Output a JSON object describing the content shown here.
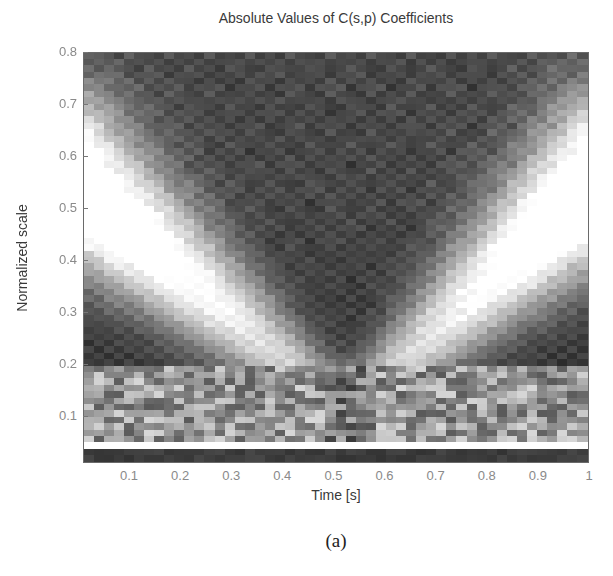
{
  "chart_data": {
    "type": "heatmap",
    "title": "Absolute Values of C(s,p) Coefficients",
    "xlabel": "Time [s]",
    "ylabel": "Normalized scale",
    "caption": "(a)",
    "colormap": "gray",
    "xlim": [
      0.01,
      1.0
    ],
    "ylim": [
      0.01,
      0.8
    ],
    "xticks": [
      0.1,
      0.2,
      0.3,
      0.4,
      0.5,
      0.6,
      0.7,
      0.8,
      0.9,
      1
    ],
    "xtick_labels": [
      "0.1",
      "0.2",
      "0.3",
      "0.4",
      "0.5",
      "0.6",
      "0.7",
      "0.8",
      "0.9",
      "1"
    ],
    "yticks": [
      0.1,
      0.2,
      0.3,
      0.4,
      0.5,
      0.6,
      0.7,
      0.8
    ],
    "ytick_labels": [
      "0.1",
      "0.2",
      "0.3",
      "0.4",
      "0.5",
      "0.6",
      "0.7",
      "0.8"
    ],
    "grid": false,
    "legend": null,
    "grid_cells": {
      "cols": 50,
      "rows": 64
    },
    "features": {
      "v_apex_time": 0.53,
      "v_apex_scale": 0.12,
      "left_ridge": {
        "from": [
          0.47,
          0.15
        ],
        "to": [
          0.01,
          0.53
        ],
        "intensity": 1.0
      },
      "right_ridge": {
        "from": [
          0.58,
          0.15
        ],
        "to": [
          1.0,
          0.53
        ],
        "intensity": 1.0
      },
      "background_level": 0.16,
      "white_band_scale": [
        0.03,
        0.05
      ],
      "dark_band_scale": [
        0.01,
        0.03
      ],
      "low_scale_noisy_band": [
        0.05,
        0.2
      ]
    }
  }
}
